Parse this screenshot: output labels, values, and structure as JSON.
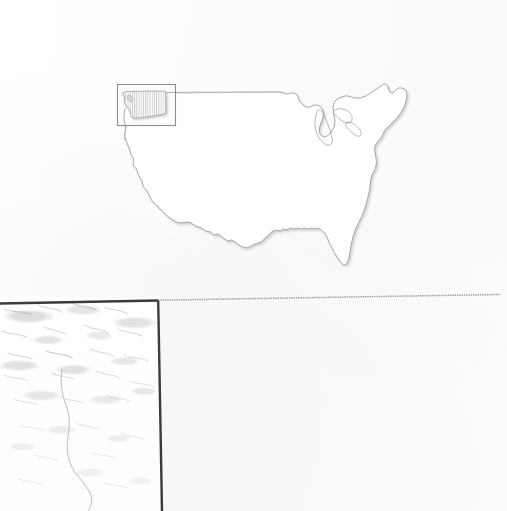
{
  "figure": {
    "kind": "scanned-map-figure",
    "background_color": "#fdfdfd",
    "width": 507,
    "height": 511,
    "caption_text": "",
    "title_text": ""
  },
  "us_map_panel": {
    "name": "contiguous-united-states-outline-map",
    "description": "Outline map of the contiguous United States with no text labels",
    "outline_color": "#9a9a9a",
    "fill_color": "#ffffff",
    "shadow_color": "#cfcfcf",
    "features": [
      "west-coast",
      "gulf-coast",
      "florida-peninsula",
      "atlantic-seaboard",
      "great-lakes",
      "northern-border",
      "maine"
    ]
  },
  "inset": {
    "name": "washington-state-inset",
    "state_name": "Washington",
    "box_color": "#8e8e8e",
    "fill_pattern": "vertical-hatch",
    "hatch_color": "#bfbfbf",
    "leader_line_color": "#bdbdbd",
    "leader_line_style": "solid-hairline",
    "box": {
      "x": 117,
      "y": 84,
      "width": 59,
      "height": 42
    }
  },
  "terrain_panel": {
    "name": "terrain-relief-detail-panel",
    "description": "Faded greyscale shaded-relief terrain detail with a thin river or boundary line",
    "border_color": "#3b3b3b",
    "relief_color": "#9aa0a6",
    "river_color": "#b9bec2",
    "box": {
      "x": 0,
      "y": 297,
      "width": 160,
      "height": 214
    }
  },
  "dividers": {
    "horizontal_rule": {
      "name": "panel-horizontal-divider",
      "color_left": "#3b3b3b",
      "color_right": "#9e9e9e",
      "style_right": "dotted-hairline",
      "y_left": 302,
      "y_right": 296,
      "x_end": 500
    },
    "vertical_rule": {
      "name": "panel-vertical-divider",
      "color": "#3b3b3b",
      "x_top": 158,
      "x_bottom": 162
    }
  },
  "blank_panel": {
    "name": "empty-lower-right-panel",
    "content": "",
    "background_color": "#fdfdfd"
  }
}
